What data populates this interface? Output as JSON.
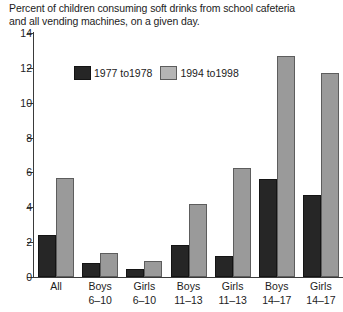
{
  "chart_data": {
    "type": "bar",
    "title": "Percent of children consuming soft drinks from school cafeteria and all vending machines, on a given day.",
    "title_lines": [
      "Percent of children consuming soft drinks from school cafeteria",
      "and all vending machines, on a given day."
    ],
    "xlabel": "",
    "ylabel": "",
    "ylim": [
      0,
      14
    ],
    "yticks": [
      0,
      2,
      4,
      6,
      8,
      10,
      12,
      14
    ],
    "ytick_labels": [
      "0",
      "2",
      "4",
      "6",
      "8",
      "10",
      "12",
      "14"
    ],
    "grid": false,
    "legend_position": "upper-left-inside",
    "categories": [
      "All",
      "Boys 6–10",
      "Girls 6–10",
      "Boys 11–13",
      "Girls 11–13",
      "Boys 14–17",
      "Girls 14–17"
    ],
    "category_lines": [
      [
        "All",
        ""
      ],
      [
        "Boys",
        "6–10"
      ],
      [
        "Girls",
        "6–10"
      ],
      [
        "Boys",
        "11–13"
      ],
      [
        "Girls",
        "11–13"
      ],
      [
        "Boys",
        "14–17"
      ],
      [
        "Girls",
        "14–17"
      ]
    ],
    "series": [
      {
        "name": "1977 to1978",
        "color": "#262626",
        "values": [
          2.4,
          0.8,
          0.45,
          1.85,
          1.2,
          5.6,
          4.7
        ]
      },
      {
        "name": "1994 to1998",
        "color": "#9a9a9a",
        "values": [
          5.7,
          1.35,
          0.9,
          4.2,
          6.25,
          12.7,
          11.7
        ]
      }
    ]
  },
  "legend": {
    "items": [
      {
        "label": "1977 to1978"
      },
      {
        "label": "1994 to1998"
      }
    ]
  }
}
